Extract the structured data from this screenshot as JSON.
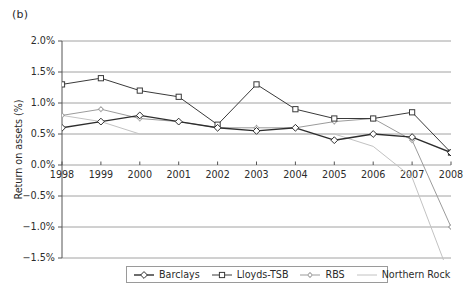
{
  "panel": {
    "label": "(b)"
  },
  "chart_data": {
    "type": "line",
    "title": "",
    "subtitle": "",
    "xlabel": "",
    "ylabel": "Return on assets (%)",
    "x": [
      1998,
      1999,
      2000,
      2001,
      2002,
      2003,
      2004,
      2005,
      2006,
      2007,
      2008
    ],
    "xtick_labels": [
      "1998",
      "1999",
      "2000",
      "2001",
      "2002",
      "2003",
      "2004",
      "2005",
      "2006",
      "2007",
      "2008"
    ],
    "ytick_labels": [
      "2.0%",
      "1.5%",
      "1.0%",
      "0.5%",
      "0.0%",
      "-0.5%",
      "-1.0%",
      "-1.5%"
    ],
    "ytick_values": [
      2.0,
      1.5,
      1.0,
      0.5,
      0.0,
      -0.5,
      -1.0,
      -1.5
    ],
    "ylim": [
      -1.5,
      2.0
    ],
    "xlim": [
      1998,
      2008
    ],
    "grid": "horizontal",
    "legend_position": "bottom",
    "series": [
      {
        "name": "Barclays",
        "color": "#2e2e2e",
        "marker": "diamond",
        "line_width": 1.4,
        "values": [
          0.6,
          0.7,
          0.8,
          0.7,
          0.6,
          0.55,
          0.6,
          0.4,
          0.5,
          0.45,
          0.2
        ]
      },
      {
        "name": "Lloyds-TSB",
        "color": "#3a3a3a",
        "marker": "square",
        "line_width": 1.0,
        "values": [
          1.3,
          1.4,
          1.2,
          1.1,
          0.65,
          1.3,
          0.9,
          0.75,
          0.75,
          0.85,
          0.2
        ]
      },
      {
        "name": "RBS",
        "color": "#9b9b9b",
        "marker": "plus",
        "line_width": 1.0,
        "values": [
          0.8,
          0.9,
          0.75,
          0.7,
          0.6,
          0.6,
          0.6,
          0.7,
          0.75,
          0.4,
          -1.0
        ]
      },
      {
        "name": "Northern Rock",
        "color": "#c2c2c2",
        "marker": "none",
        "line_width": 1.0,
        "values": [
          0.8,
          0.7,
          0.5,
          0.5,
          0.5,
          0.5,
          0.5,
          0.5,
          0.3,
          -0.2,
          -1.85
        ]
      }
    ]
  },
  "legend": {
    "entries": [
      {
        "label": "Barclays"
      },
      {
        "label": "Lloyds-TSB"
      },
      {
        "label": "RBS"
      },
      {
        "label": "Northern Rock"
      }
    ]
  }
}
